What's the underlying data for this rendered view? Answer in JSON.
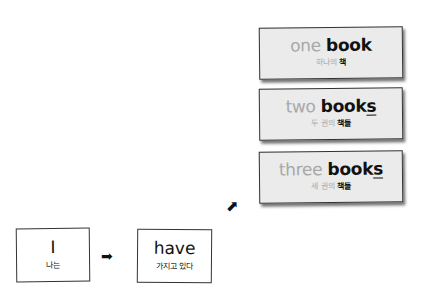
{
  "cards": [
    {
      "number_en": "one",
      "noun_en": "book",
      "plural_suffix": "",
      "number_ko": "하나의",
      "noun_ko": "책"
    },
    {
      "number_en": "two",
      "noun_en": "book",
      "plural_suffix": "s",
      "number_ko": "두 권의",
      "noun_ko": "책들"
    },
    {
      "number_en": "three",
      "noun_en": "book",
      "plural_suffix": "s",
      "number_ko": "세 권의",
      "noun_ko": "책들"
    }
  ],
  "subject": {
    "en": "I",
    "ko": "나는"
  },
  "verb": {
    "en": "have",
    "ko": "가지고 있다"
  },
  "arrows": {
    "right": "➡",
    "up_right": "⬈"
  },
  "colors": {
    "card_bg": "#ebebeb",
    "muted_text": "#a8a8a8",
    "border": "#333333"
  }
}
